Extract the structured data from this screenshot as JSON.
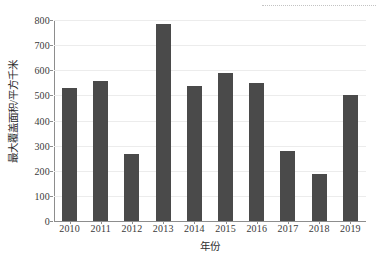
{
  "chart_data": {
    "type": "bar",
    "title": "",
    "subtitle": "",
    "xlabel": "年份",
    "ylabel": "最大覆盖面积/平方千米",
    "categories": [
      "2010",
      "2011",
      "2012",
      "2013",
      "2014",
      "2015",
      "2016",
      "2017",
      "2018",
      "2019"
    ],
    "values": [
      530,
      557,
      265,
      786,
      537,
      591,
      550,
      277,
      186,
      502
    ],
    "series": [
      {
        "name": "最大覆盖面积",
        "values": [
          530,
          557,
          265,
          786,
          537,
          591,
          550,
          277,
          186,
          502
        ]
      }
    ],
    "ylim": [
      0,
      800
    ],
    "ytick_labels": [
      "0",
      "100",
      "200",
      "300",
      "400",
      "500",
      "600",
      "700",
      "800"
    ],
    "ytick_values": [
      0,
      100,
      200,
      300,
      400,
      500,
      600,
      700,
      800
    ],
    "xtick_labels": [
      "2010",
      "2011",
      "2012",
      "2013",
      "2014",
      "2015",
      "2016",
      "2017",
      "2018",
      "2019"
    ],
    "grid": true,
    "grid_axis": "y",
    "legend": false,
    "legend_position": "none",
    "bar_color": "#4a4a4a",
    "grid_color": "#ececec",
    "axis_color": "#8d8d8d",
    "background_color": "#ffffff",
    "annotations": [
      {
        "name": "top-dotted-rule",
        "style": "dotted-horizontal-line",
        "color": "#b9b9b9"
      }
    ]
  }
}
